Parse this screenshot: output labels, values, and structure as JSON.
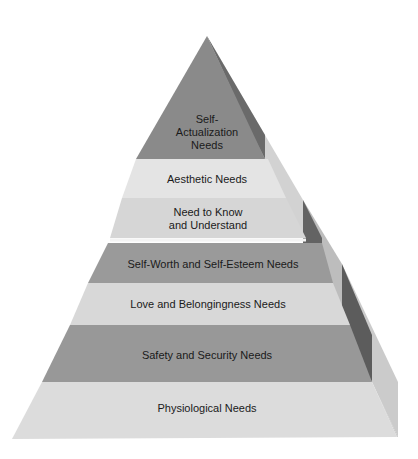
{
  "diagram": {
    "levels": [
      {
        "label": "Self-\nActualization\nNeeds",
        "color": "#8a8a8a"
      },
      {
        "label": "Aesthetic Needs",
        "color": "#e4e4e4"
      },
      {
        "label": "Need to Know\nand Understand",
        "color": "#d6d6d6"
      },
      {
        "label": "Self-Worth and Self-Esteem Needs",
        "color": "#9a9a9a"
      },
      {
        "label": "Love and Belongingness Needs",
        "color": "#d8d8d8"
      },
      {
        "label": "Safety and Security Needs",
        "color": "#989898"
      },
      {
        "label": "Physiological Needs",
        "color": "#dcdcdc"
      }
    ],
    "colors": {
      "side_dark": "#5e5e5e",
      "side_mid": "#a8a8a8",
      "side_light": "#c8c8c8",
      "background": "#ffffff"
    }
  }
}
